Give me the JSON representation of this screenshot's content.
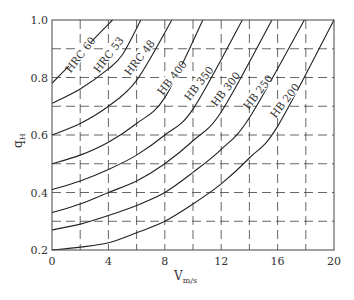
{
  "chart_data": {
    "type": "line",
    "title": "",
    "xlabel": "V",
    "xlabel_sub": "m/s",
    "ylabel": "q",
    "ylabel_sub": "H",
    "xlim": [
      0,
      20
    ],
    "ylim": [
      0.2,
      1.0
    ],
    "x_ticks": [
      0,
      4,
      8,
      12,
      16,
      20
    ],
    "y_ticks": [
      0.2,
      0.4,
      0.6,
      0.8,
      1.0
    ],
    "y_tick_labels": [
      "0.2",
      "0.4",
      "0.6",
      "0.8",
      "1.0"
    ],
    "grid": {
      "style": "dashed",
      "x_every": 2,
      "y_every": 0.1
    },
    "legend": "inline labels along curves",
    "series": [
      {
        "name": "HRC 60",
        "x": [
          0,
          1,
          2,
          3,
          4.3
        ],
        "y": [
          0.78,
          0.83,
          0.88,
          0.935,
          1.0
        ]
      },
      {
        "name": "HRC 53",
        "x": [
          0,
          2,
          4,
          5,
          6.3
        ],
        "y": [
          0.71,
          0.76,
          0.83,
          0.88,
          1.0
        ]
      },
      {
        "name": "HRC 48",
        "x": [
          0,
          2,
          4,
          6,
          8.5
        ],
        "y": [
          0.6,
          0.64,
          0.7,
          0.79,
          1.0
        ]
      },
      {
        "name": "HB 400",
        "x": [
          0,
          2,
          4,
          6,
          8,
          10.7
        ],
        "y": [
          0.5,
          0.53,
          0.575,
          0.64,
          0.73,
          1.0
        ]
      },
      {
        "name": "HB 350",
        "x": [
          0,
          2,
          4,
          6,
          8,
          10,
          13.5
        ],
        "y": [
          0.41,
          0.44,
          0.48,
          0.53,
          0.6,
          0.69,
          1.0
        ]
      },
      {
        "name": "HB 300",
        "x": [
          0,
          2,
          4,
          6,
          8,
          10,
          12,
          15.6
        ],
        "y": [
          0.33,
          0.36,
          0.4,
          0.44,
          0.5,
          0.58,
          0.68,
          1.0
        ]
      },
      {
        "name": "HB 250",
        "x": [
          0,
          2,
          4,
          6,
          8,
          10,
          12,
          14,
          17.9
        ],
        "y": [
          0.27,
          0.29,
          0.32,
          0.355,
          0.4,
          0.47,
          0.55,
          0.66,
          1.0
        ]
      },
      {
        "name": "HB 200",
        "x": [
          0,
          2,
          4,
          6,
          8,
          10,
          12,
          14,
          16,
          20
        ],
        "y": [
          0.2,
          0.21,
          0.225,
          0.26,
          0.3,
          0.36,
          0.43,
          0.52,
          0.63,
          1.0
        ]
      }
    ],
    "label_positions": [
      {
        "name": "HRC 60",
        "x": 2.0,
        "y": 0.88
      },
      {
        "name": "HRC 53",
        "x": 4.0,
        "y": 0.88
      },
      {
        "name": "HRC 48",
        "x": 6.2,
        "y": 0.87
      },
      {
        "name": "HB 400",
        "x": 8.5,
        "y": 0.8
      },
      {
        "name": "HB 350",
        "x": 10.4,
        "y": 0.78
      },
      {
        "name": "HB 300",
        "x": 12.3,
        "y": 0.76
      },
      {
        "name": "HB 250",
        "x": 14.6,
        "y": 0.75
      },
      {
        "name": "HB 200",
        "x": 16.5,
        "y": 0.72
      }
    ]
  }
}
